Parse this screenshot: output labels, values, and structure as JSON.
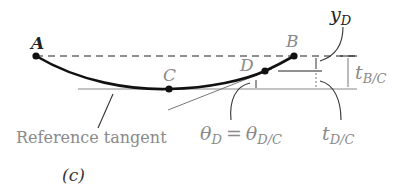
{
  "figure": {
    "panel_label": "(c)",
    "points": {
      "A": "A",
      "B": "B",
      "C": "C",
      "D": "D"
    },
    "labels": {
      "y_D": "y",
      "y_D_sub": "D",
      "t_BC": "t",
      "t_BC_sub": "B/C",
      "t_DC": "t",
      "t_DC_sub": "D/C",
      "theta_lhs": "θ",
      "theta_lhs_sub": "D",
      "theta_eq": "=",
      "theta_rhs": "θ",
      "theta_rhs_sub": "D/C",
      "reference_tangent": "Reference tangent"
    },
    "colors": {
      "curve": "#111111",
      "thin_line": "#777777",
      "label_gray": "#8a8a8a",
      "label_dark": "#222222"
    }
  }
}
